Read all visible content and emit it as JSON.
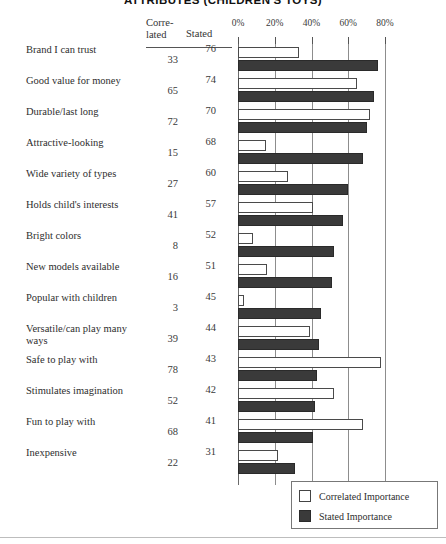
{
  "title": "ATTRIBUTES (CHILDREN'S TOYS)",
  "headers": {
    "correlated": "Corre-\nlated",
    "correlated_line1": "Corre-",
    "correlated_line2": "lated",
    "stated": "Stated"
  },
  "legend": {
    "position": "bottom-right",
    "items": [
      {
        "label": "Correlated Importance",
        "swatch": "hollow-white-square",
        "color": "#ffffff"
      },
      {
        "label": "Stated Importance",
        "swatch": "filled-dark-square",
        "color": "#3a3a3a"
      }
    ]
  },
  "chart_data": {
    "type": "bar",
    "orientation": "horizontal",
    "title": "ATTRIBUTES (CHILDREN'S TOYS)",
    "xlabel": "",
    "ylabel": "",
    "xlim": [
      0,
      80
    ],
    "xticks": [
      0,
      20,
      40,
      60,
      80
    ],
    "xticklabels": [
      "0%",
      "20%",
      "40%",
      "60%",
      "80%"
    ],
    "grid": true,
    "legend_position": "bottom-right",
    "categories": [
      "Brand I can trust",
      "Good value for money",
      "Durable/last long",
      "Attractive-looking",
      "Wide variety of types",
      "Holds child's interests",
      "Bright colors",
      "New models available",
      "Popular with children",
      "Versatile/can play many ways",
      "Safe to play with",
      "Stimulates imagination",
      "Fun to play with",
      "Inexpensive"
    ],
    "series": [
      {
        "name": "Correlated Importance",
        "color": "#ffffff",
        "values": [
          33,
          65,
          72,
          15,
          27,
          41,
          8,
          16,
          3,
          39,
          78,
          52,
          68,
          22
        ]
      },
      {
        "name": "Stated Importance",
        "color": "#3a3a3a",
        "values": [
          76,
          74,
          70,
          68,
          60,
          57,
          52,
          51,
          45,
          44,
          43,
          42,
          41,
          31
        ]
      }
    ]
  },
  "rows": [
    {
      "label": "Brand I can trust",
      "correlated": 33,
      "stated": 76
    },
    {
      "label": "Good value for money",
      "correlated": 65,
      "stated": 74
    },
    {
      "label": "Durable/last long",
      "correlated": 72,
      "stated": 70
    },
    {
      "label": "Attractive-looking",
      "correlated": 15,
      "stated": 68
    },
    {
      "label": "Wide variety of types",
      "correlated": 27,
      "stated": 60
    },
    {
      "label": "Holds child's interests",
      "correlated": 41,
      "stated": 57
    },
    {
      "label": "Bright colors",
      "correlated": 8,
      "stated": 52
    },
    {
      "label": "New models available",
      "correlated": 16,
      "stated": 51
    },
    {
      "label": "Popular with children",
      "correlated": 3,
      "stated": 45
    },
    {
      "label": "Versatile/can play many ways",
      "correlated": 39,
      "stated": 44
    },
    {
      "label": "Safe to play with",
      "correlated": 78,
      "stated": 43
    },
    {
      "label": "Stimulates imagination",
      "correlated": 52,
      "stated": 42
    },
    {
      "label": "Fun to play with",
      "correlated": 68,
      "stated": 41
    },
    {
      "label": "Inexpensive",
      "correlated": 22,
      "stated": 31
    }
  ]
}
